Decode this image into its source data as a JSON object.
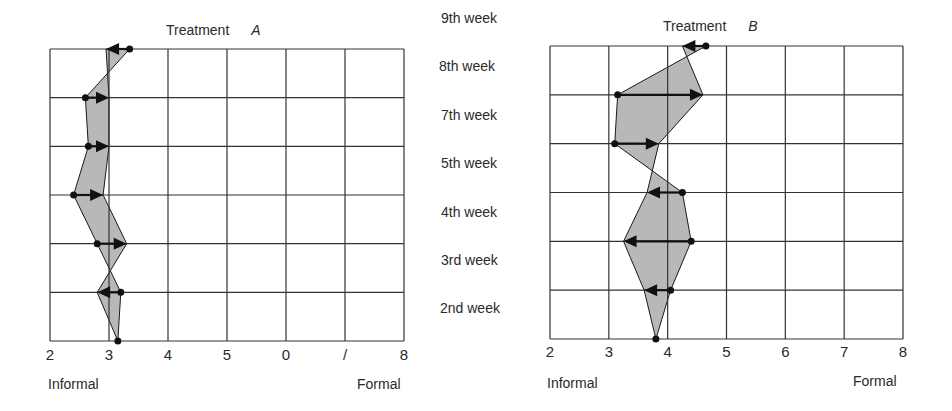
{
  "chart_data": [
    {
      "type": "line",
      "title": "Treatment A",
      "title_text": "Treatment",
      "title_letter": "A",
      "xlabel_left": "Informal",
      "xlabel_right": "Formal",
      "xlim": [
        2,
        8
      ],
      "x_ticks": [
        2,
        3,
        4,
        5,
        6,
        7,
        8
      ],
      "x_tick_labels_as_printed": [
        "2",
        "3",
        "4",
        "5",
        "0",
        "/",
        "8"
      ],
      "categories": [
        "9th week",
        "8th week",
        "7th week",
        "5th week",
        "4th week",
        "3rd week",
        "2nd week"
      ],
      "grid": true,
      "series": [
        {
          "name": "start (dot)",
          "values": [
            3.35,
            2.6,
            2.65,
            2.4,
            2.8,
            3.2,
            3.15
          ]
        },
        {
          "name": "end (arrowhead)",
          "values": [
            2.95,
            3.0,
            3.0,
            2.9,
            3.3,
            2.8,
            null
          ]
        }
      ],
      "reference_x": 3.0
    },
    {
      "type": "line",
      "title": "Treatment B",
      "title_text": "Treatment",
      "title_letter": "B",
      "xlabel_left": "Informal",
      "xlabel_right": "Formal",
      "xlim": [
        2,
        8
      ],
      "x_ticks": [
        2,
        3,
        4,
        5,
        6,
        7,
        8
      ],
      "x_tick_labels_as_printed": [
        "2",
        "3",
        "4",
        "5",
        "6",
        "7",
        "8"
      ],
      "categories": [
        "9th week",
        "8th week",
        "7th week",
        "5th week",
        "4th week",
        "3rd week",
        "2nd week"
      ],
      "grid": true,
      "series": [
        {
          "name": "start (dot)",
          "values": [
            4.65,
            3.15,
            3.1,
            4.25,
            4.4,
            4.05,
            3.8
          ]
        },
        {
          "name": "end (arrowhead)",
          "values": [
            4.25,
            4.6,
            3.85,
            3.65,
            3.25,
            3.6,
            null
          ]
        }
      ],
      "reference_x": 4.0
    }
  ],
  "week_labels": [
    "9th week",
    "8th week",
    "7th week",
    "5th week",
    "4th week",
    "3rd week",
    "2nd week"
  ],
  "colors": {
    "grid": "#333333",
    "fill": "#b8b8b8",
    "line": "#1a1a1a",
    "marker": "#111111"
  }
}
